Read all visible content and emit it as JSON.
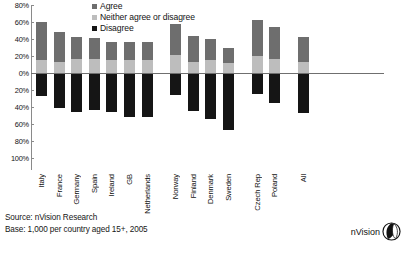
{
  "legend": {
    "position": "top-center",
    "items": [
      {
        "label": "Agree",
        "color": "#6e6e6e",
        "icon": "square-swatch-icon"
      },
      {
        "label": "Neither agree or disagree",
        "color": "#bdbdbd",
        "icon": "square-swatch-icon"
      },
      {
        "label": "Disagree",
        "color": "#151515",
        "icon": "square-swatch-icon"
      }
    ]
  },
  "footer": {
    "source": "Source: nVision Research",
    "base": "Base: 1,000 per country aged 15+, 2005"
  },
  "brand": {
    "name": "nVision",
    "mark": "nvision-logo-icon"
  },
  "chart_data": {
    "type": "bar",
    "title": "",
    "subtitle": "",
    "xlabel": "",
    "ylabel": "",
    "orientation": "vertical",
    "stacked": true,
    "diverging": true,
    "grid": false,
    "ylim": [
      -100,
      80
    ],
    "ytick_labels": [
      "80%",
      "60%",
      "40%",
      "20%",
      "0%",
      "20%",
      "40%",
      "60%",
      "80%",
      "100%"
    ],
    "ytick_values": [
      80,
      60,
      40,
      20,
      0,
      -20,
      -40,
      -60,
      -80,
      -100
    ],
    "categories": [
      "Italy",
      "France",
      "Germany",
      "Spain",
      "Ireland",
      "GB",
      "Netherlands",
      "Norway",
      "Finland",
      "Denmark",
      "Sweden",
      "Czech Rep",
      "Poland",
      "All"
    ],
    "group_gaps_after": [
      "Netherlands",
      "Sweden",
      "Poland"
    ],
    "series": [
      {
        "name": "Agree",
        "color": "#6e6e6e",
        "values": [
          45,
          35,
          26,
          25,
          22,
          21,
          21,
          37,
          30,
          25,
          17,
          42,
          38,
          29
        ]
      },
      {
        "name": "Neither agree or disagree",
        "color": "#bdbdbd",
        "values": [
          15,
          13,
          16,
          16,
          15,
          15,
          15,
          21,
          13,
          15,
          12,
          20,
          16,
          13
        ]
      },
      {
        "name": "Disagree",
        "color": "#151515",
        "values": [
          -27,
          -41,
          -46,
          -44,
          -46,
          -52,
          -52,
          -26,
          -45,
          -54,
          -67,
          -25,
          -35,
          -47
        ]
      }
    ]
  }
}
